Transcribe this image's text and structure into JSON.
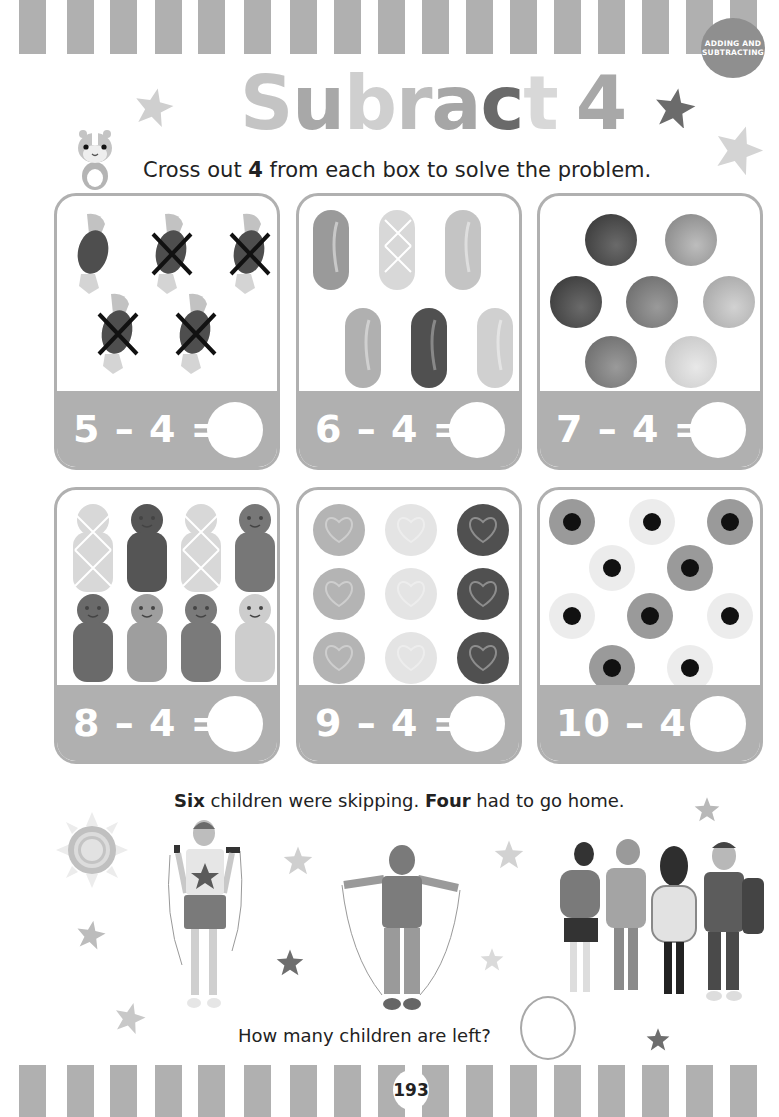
{
  "header": {
    "badge": "ADDING AND\nSUBTRACTING",
    "title_letters": [
      {
        "ch": "S",
        "color": "#c4c4c4"
      },
      {
        "ch": "u",
        "color": "#a8a8a8"
      },
      {
        "ch": "b",
        "color": "#cfcfcf"
      },
      {
        "ch": "r",
        "color": "#bdbdbd"
      },
      {
        "ch": "a",
        "color": "#a6a6a6"
      },
      {
        "ch": "c",
        "color": "#6a6a6a"
      },
      {
        "ch": "t",
        "color": "#d8d8d8"
      },
      {
        "ch": " ",
        "color": "#ffffff"
      },
      {
        "ch": "4",
        "color": "#a8a8a8"
      }
    ],
    "title": "Subract 4",
    "instruction_pre": "Cross out ",
    "instruction_bold": "4",
    "instruction_post": " from each box to solve the problem."
  },
  "problems": [
    {
      "equation": "5 – 4 =",
      "items": "wrapped-sweets",
      "count": 5,
      "crossed": 4
    },
    {
      "equation": "6 – 4 =",
      "items": "jelly-beans",
      "count": 6,
      "crossed": 0
    },
    {
      "equation": "7 – 4 =",
      "items": "chocolate-buttons",
      "count": 7,
      "crossed": 0
    },
    {
      "equation": "8 – 4 =",
      "items": "jelly-babies",
      "count": 8,
      "crossed": 0
    },
    {
      "equation": "9 – 4 =",
      "items": "love-heart-sweets",
      "count": 9,
      "crossed": 0
    },
    {
      "equation": "10 – 4 =",
      "items": "candy-eyes",
      "count": 10,
      "crossed": 0
    }
  ],
  "story": {
    "bold1": "Six",
    "text1": " children were skipping. ",
    "bold2": "Four",
    "text2": " had to go home.",
    "question": "How many children are left?"
  },
  "footer": {
    "page_number": "193"
  },
  "colors": {
    "stripe": "#b0b0b0",
    "box_border": "#b0b0b0",
    "badge": "#8f8f8f"
  }
}
